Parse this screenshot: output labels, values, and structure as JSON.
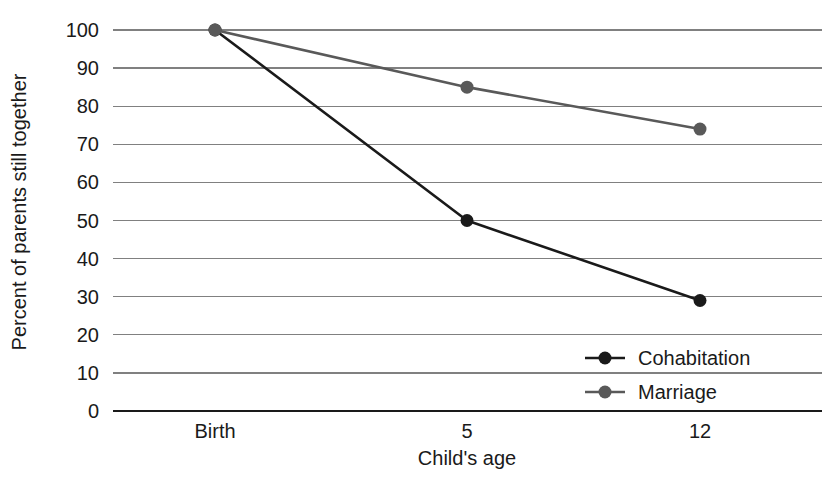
{
  "chart_data": {
    "type": "line",
    "title": "",
    "xlabel": "Child's age",
    "ylabel": "Percent of parents still together",
    "categories": [
      "Birth",
      "5",
      "12"
    ],
    "x_tick_labels": [
      "Birth",
      "5",
      "12"
    ],
    "y_tick_labels": [
      "0",
      "10",
      "20",
      "30",
      "40",
      "50",
      "60",
      "70",
      "80",
      "90",
      "100"
    ],
    "y_ticks": [
      0,
      10,
      20,
      30,
      40,
      50,
      60,
      70,
      80,
      90,
      100
    ],
    "ylim": [
      0,
      100
    ],
    "grid": true,
    "grid_axis": "y",
    "legend_position": "inside-lower-right",
    "series": [
      {
        "name": "Cohabitation",
        "values": [
          100,
          50,
          29
        ],
        "color": "#1a1a1a",
        "marker": "circle"
      },
      {
        "name": "Marriage",
        "values": [
          100,
          85,
          74
        ],
        "color": "#595959",
        "marker": "circle"
      }
    ]
  },
  "axes": {
    "y_label": "Percent of parents still together",
    "x_label": "Child's age"
  },
  "legend": {
    "items": [
      {
        "label": "Cohabitation",
        "color": "#1a1a1a"
      },
      {
        "label": "Marriage",
        "color": "#595959"
      }
    ]
  },
  "colors": {
    "cohabitation": "#1a1a1a",
    "marriage": "#595959",
    "gridline": "#808080",
    "axis": "#1a1a1a",
    "background": "#ffffff"
  }
}
